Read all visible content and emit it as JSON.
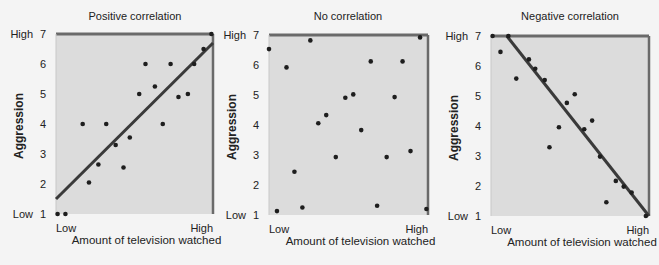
{
  "chart_data": [
    {
      "type": "scatter",
      "title": "Positive correlation",
      "xlabel": "Amount of television watched",
      "ylabel": "Aggression",
      "x_tick_labels": [
        "Low",
        "High"
      ],
      "y_ticks": [
        1,
        2,
        3,
        4,
        5,
        6,
        7
      ],
      "y_tick_extra_labels": {
        "1": "Low",
        "7": "High"
      },
      "xlim": [
        0,
        1
      ],
      "ylim": [
        1,
        7
      ],
      "trend_line": {
        "x": [
          0,
          1
        ],
        "y": [
          1.5,
          6.7
        ]
      },
      "points": [
        [
          0.01,
          1
        ],
        [
          0.06,
          1
        ],
        [
          0.17,
          4
        ],
        [
          0.21,
          2.05
        ],
        [
          0.27,
          2.65
        ],
        [
          0.32,
          4
        ],
        [
          0.38,
          3.3
        ],
        [
          0.43,
          2.55
        ],
        [
          0.47,
          3.55
        ],
        [
          0.53,
          5
        ],
        [
          0.57,
          6
        ],
        [
          0.63,
          5.25
        ],
        [
          0.68,
          4
        ],
        [
          0.73,
          6
        ],
        [
          0.78,
          4.9
        ],
        [
          0.84,
          5
        ],
        [
          0.88,
          6
        ],
        [
          0.94,
          6.5
        ],
        [
          0.99,
          7
        ]
      ]
    },
    {
      "type": "scatter",
      "title": "No correlation",
      "xlabel": "Amount of television watched",
      "ylabel": "Aggression",
      "x_tick_labels": [
        "Low",
        "High"
      ],
      "y_ticks": [
        1,
        2,
        3,
        4,
        5,
        6,
        7
      ],
      "y_tick_extra_labels": {
        "1": "Low",
        "7": "High"
      },
      "xlim": [
        0,
        1
      ],
      "ylim": [
        1,
        7
      ],
      "trend_line": null,
      "points": [
        [
          0.0,
          6.53
        ],
        [
          0.05,
          1.13
        ],
        [
          0.11,
          5.92
        ],
        [
          0.16,
          2.44
        ],
        [
          0.21,
          1.25
        ],
        [
          0.26,
          6.82
        ],
        [
          0.31,
          4.06
        ],
        [
          0.36,
          4.33
        ],
        [
          0.42,
          2.93
        ],
        [
          0.48,
          4.91
        ],
        [
          0.53,
          5.02
        ],
        [
          0.58,
          3.83
        ],
        [
          0.64,
          6.12
        ],
        [
          0.68,
          1.31
        ],
        [
          0.74,
          2.93
        ],
        [
          0.79,
          4.93
        ],
        [
          0.84,
          6.12
        ],
        [
          0.89,
          3.13
        ],
        [
          0.95,
          6.92
        ],
        [
          0.99,
          1.2
        ]
      ]
    },
    {
      "type": "scatter",
      "title": "Negative correlation",
      "xlabel": "Amount of television watched",
      "ylabel": "Aggression",
      "x_tick_labels": [
        "Low",
        "High"
      ],
      "y_ticks": [
        1,
        2,
        3,
        4,
        5,
        6,
        7
      ],
      "y_tick_extra_labels": {
        "1": "Low",
        "7": "High"
      },
      "xlim": [
        0,
        1
      ],
      "ylim": [
        1,
        7
      ],
      "trend_line": {
        "x": [
          0.1,
          1
        ],
        "y": [
          7,
          1
        ]
      },
      "points": [
        [
          0.01,
          7
        ],
        [
          0.06,
          6.47
        ],
        [
          0.11,
          7
        ],
        [
          0.16,
          5.58
        ],
        [
          0.24,
          6.22
        ],
        [
          0.28,
          5.91
        ],
        [
          0.34,
          5.53
        ],
        [
          0.37,
          3.29
        ],
        [
          0.43,
          3.96
        ],
        [
          0.48,
          4.77
        ],
        [
          0.53,
          5.06
        ],
        [
          0.59,
          3.89
        ],
        [
          0.64,
          4.18
        ],
        [
          0.69,
          2.98
        ],
        [
          0.73,
          1.46
        ],
        [
          0.79,
          2.17
        ],
        [
          0.84,
          1.98
        ],
        [
          0.89,
          1.78
        ],
        [
          0.98,
          1
        ]
      ]
    }
  ],
  "style": {
    "plot_bg": "#dcdcdc",
    "frame_color": "#6a6a6a",
    "point_color": "#1e1e1e",
    "line_color": "#3a3a3a"
  },
  "layout": [
    {
      "left": 56,
      "top": 34,
      "width": 157,
      "height": 180,
      "title_x": 135
    },
    {
      "left": 269,
      "top": 35,
      "width": 159,
      "height": 180,
      "title_x": 348
    },
    {
      "left": 491,
      "top": 36,
      "width": 158,
      "height": 180,
      "title_x": 570
    }
  ]
}
